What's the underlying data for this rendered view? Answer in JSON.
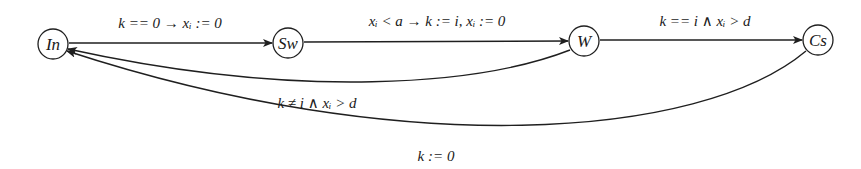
{
  "diagram": {
    "type": "state-machine",
    "nodes": [
      {
        "id": "In",
        "label": "In"
      },
      {
        "id": "Sw",
        "label": "Sw"
      },
      {
        "id": "W",
        "label": "W"
      },
      {
        "id": "Cs",
        "label": "Cs"
      }
    ],
    "edges": [
      {
        "from": "In",
        "to": "Sw",
        "label": "k == 0 → xᵢ := 0"
      },
      {
        "from": "Sw",
        "to": "W",
        "label": "xᵢ < a → k := i, xᵢ := 0"
      },
      {
        "from": "W",
        "to": "Cs",
        "label": "k == i ∧ xᵢ > d"
      },
      {
        "from": "W",
        "to": "In",
        "label": "k ≠ i ∧ xᵢ > d"
      },
      {
        "from": "Cs",
        "to": "In",
        "label": "k := 0"
      }
    ]
  }
}
